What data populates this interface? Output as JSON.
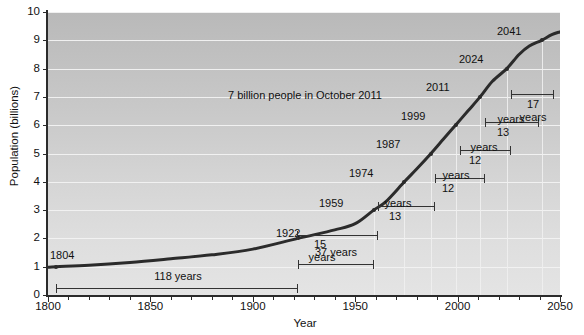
{
  "chart_data": {
    "type": "line",
    "title": "",
    "xlabel": "Year",
    "ylabel": "Population (billions)",
    "xlim": [
      1800,
      2050
    ],
    "ylim": [
      0,
      10
    ],
    "grid": true,
    "legend": null,
    "x_ticks": [
      "1800",
      "1850",
      "1900",
      "1950",
      "2000",
      "2050"
    ],
    "x_tick_values": [
      1800,
      1850,
      1900,
      1950,
      2000,
      2050
    ],
    "y_ticks": [
      "0",
      "1",
      "2",
      "3",
      "4",
      "5",
      "6",
      "7",
      "8",
      "9",
      "10"
    ],
    "y_tick_values": [
      0,
      1,
      2,
      3,
      4,
      5,
      6,
      7,
      8,
      9,
      10
    ],
    "series": [
      {
        "name": "World population",
        "x": [
          1800,
          1804,
          1820,
          1840,
          1860,
          1880,
          1900,
          1922,
          1940,
          1950,
          1959,
          1965,
          1974,
          1980,
          1987,
          1993,
          1999,
          2005,
          2011,
          2017,
          2024,
          2030,
          2035,
          2041,
          2046,
          2050
        ],
        "y": [
          0.98,
          1.0,
          1.05,
          1.15,
          1.28,
          1.42,
          1.62,
          2.0,
          2.3,
          2.52,
          3.0,
          3.3,
          4.0,
          4.45,
          5.0,
          5.5,
          6.0,
          6.5,
          7.0,
          7.55,
          8.0,
          8.5,
          8.8,
          9.0,
          9.2,
          9.3
        ]
      }
    ],
    "milestone_points": [
      {
        "label": "1804",
        "year": 1804,
        "population": 1
      },
      {
        "label": "1922",
        "year": 1922,
        "population": 2
      },
      {
        "label": "1959",
        "year": 1959,
        "population": 3
      },
      {
        "label": "1974",
        "year": 1974,
        "population": 4
      },
      {
        "label": "1987",
        "year": 1987,
        "population": 5
      },
      {
        "label": "1999",
        "year": 1999,
        "population": 6
      },
      {
        "label": "2011",
        "year": 2011,
        "population": 7
      },
      {
        "label": "2024",
        "year": 2024,
        "population": 8
      },
      {
        "label": "2041",
        "year": 2041,
        "population": 9
      }
    ],
    "interval_brackets": [
      {
        "label": "118 years",
        "from_year": 1804,
        "to_year": 1922,
        "years": 118
      },
      {
        "label": "37 years",
        "from_year": 1922,
        "to_year": 1959,
        "years": 37
      },
      {
        "label": "15 years",
        "from_year": 1959,
        "to_year": 1974,
        "years": 15
      },
      {
        "label": "13 years",
        "from_year": 1974,
        "to_year": 1987,
        "years": 13
      },
      {
        "label": "12 years",
        "from_year": 1987,
        "to_year": 1999,
        "years": 12
      },
      {
        "label": "12 years",
        "from_year": 1999,
        "to_year": 2011,
        "years": 12
      },
      {
        "label": "13 years",
        "from_year": 2011,
        "to_year": 2024,
        "years": 13
      },
      {
        "label": "17 years",
        "from_year": 2024,
        "to_year": 2041,
        "years": 17
      }
    ],
    "annotations": [
      {
        "text": "7 billion people in October 2011",
        "year": 1910,
        "population": 7.35
      }
    ]
  },
  "axes": {
    "y_title": "Population (billions)",
    "x_title": "Year",
    "y_labels": [
      "10",
      "9",
      "8",
      "7",
      "6",
      "5",
      "4",
      "3",
      "2",
      "1",
      "0"
    ],
    "x_labels": [
      "1800",
      "1850",
      "1900",
      "1950",
      "2000",
      "2050"
    ]
  },
  "milestones": {
    "m1804": "1804",
    "m1922": "1922",
    "m1959": "1959",
    "m1974": "1974",
    "m1987": "1987",
    "m1999": "1999",
    "m2011": "2011",
    "m2024": "2024",
    "m2041": "2041"
  },
  "spans": {
    "s118": "118 years",
    "s37": "37 years",
    "s15_a": "15",
    "s15_b": "years",
    "s13_a": "13",
    "s13_b": "years",
    "s12_a": "12",
    "s12_b": "years",
    "s12b_a": "12",
    "s12b_b": "years",
    "s13b_a": "13",
    "s13b_b": "years",
    "s17_a": "17",
    "s17_b": "years"
  },
  "callout": {
    "text": "7 billion people in October 2011"
  },
  "colors": {
    "curve": "#2b2b2b",
    "axis": "#2b2b2b",
    "gridline": "#f2f2f2",
    "plot_bg_top": "#b9b9b9",
    "plot_bg_bottom": "#e4e4e4",
    "text": "#111111"
  }
}
